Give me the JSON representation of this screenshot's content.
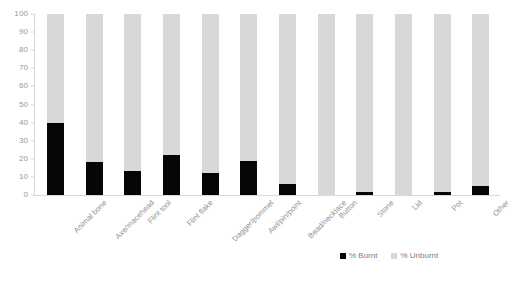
{
  "chart_data": {
    "type": "bar",
    "subtype": "100% stacked column",
    "title": "",
    "xlabel": "",
    "ylabel": "",
    "ylim": [
      0,
      100
    ],
    "yticks": [
      0,
      10,
      20,
      30,
      40,
      50,
      60,
      70,
      80,
      90,
      100
    ],
    "ytick_labels": [
      "0",
      "10",
      "20",
      "30",
      "40",
      "50",
      "60",
      "70",
      "80",
      "90",
      "100"
    ],
    "grid": false,
    "legend_position": "bottom-right",
    "categories": [
      "Animal bone",
      "Axe/macehead",
      "Flint tool",
      "Flint flake",
      "Dagger/pommel",
      "Awl/pin/point",
      "Bead/necklace",
      "Button",
      "Stone",
      "Lid",
      "Pot",
      "Other"
    ],
    "series": [
      {
        "name": "% Burnt",
        "color": "#060606",
        "values": [
          40,
          18,
          13,
          22,
          12,
          19,
          6,
          0,
          1.5,
          0,
          1.5,
          5
        ]
      },
      {
        "name": "% Unburnt",
        "color": "#d8d8d8",
        "values": [
          60,
          82,
          87,
          78,
          88,
          81,
          94,
          100,
          98.5,
          100,
          98.5,
          95
        ]
      }
    ]
  },
  "legend": {
    "items": [
      {
        "label": "% Burnt",
        "color": "#060606"
      },
      {
        "label": "% Unburnt",
        "color": "#d8d8d8"
      }
    ]
  },
  "axis": {
    "axis_color": "#d9d9d9",
    "tick_label_color": "#9a9a9a"
  }
}
